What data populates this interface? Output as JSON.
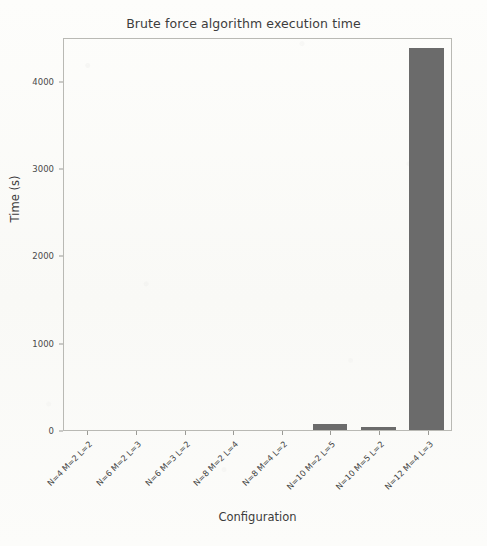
{
  "chart_data": {
    "type": "bar",
    "title": "Brute force algorithm execution time",
    "xlabel": "Configuration",
    "ylabel": "Time (s)",
    "categories": [
      "N=4 M=2 L=2",
      "N=6 M=2 L=3",
      "N=6 M=3 L=2",
      "N=8 M=2 L=4",
      "N=8 M=4 L=2",
      "N=10 M=2 L=5",
      "N=10 M=5 L=2",
      "N=12 M=4 L=3"
    ],
    "values": [
      0,
      0,
      0,
      0,
      0,
      70,
      35,
      4370
    ],
    "ylim": [
      0,
      4500
    ],
    "yticks": [
      0,
      1000,
      2000,
      3000,
      4000
    ],
    "ytick_labels": [
      "0",
      "1000",
      "2000",
      "3000",
      "4000"
    ],
    "grid": false,
    "legend": null,
    "bar_color": "#6b6b6b",
    "axes_color": "#b9b9b4",
    "background_color": "#fbfbf9"
  }
}
